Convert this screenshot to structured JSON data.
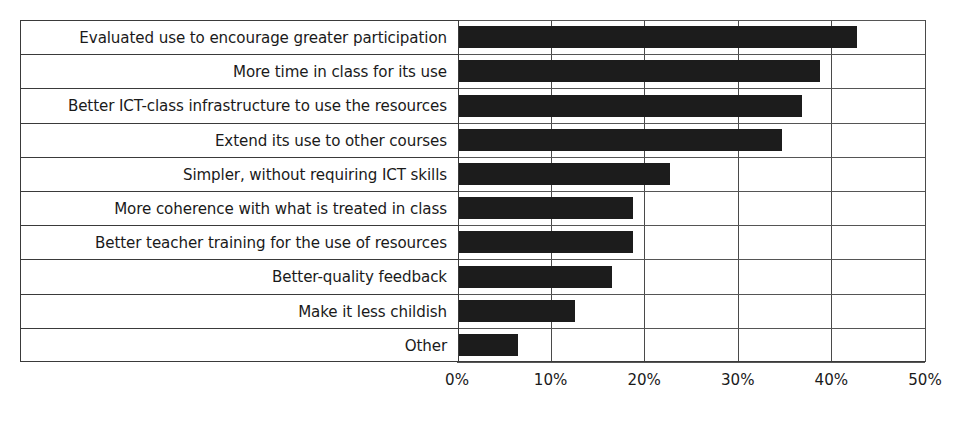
{
  "chart_data": {
    "type": "bar",
    "orientation": "horizontal",
    "title": "",
    "xlabel": "",
    "ylabel": "",
    "xlim": [
      0,
      50
    ],
    "xticks": [
      0,
      10,
      20,
      30,
      40,
      50
    ],
    "xtick_labels": [
      "0%",
      "10%",
      "20%",
      "30%",
      "40%",
      "50%"
    ],
    "grid": "vertical",
    "legend": "none",
    "bar_color": "#1c1c1c",
    "categories": [
      "Evaluated use to encourage greater participation",
      "More time in class for its use",
      "Better ICT-class infrastructure to use the resources",
      "Extend its use to other courses",
      "Simpler, without requiring ICT skills",
      "More coherence with what is treated in class",
      "Better teacher training for the use of resources",
      "Better-quality feedback",
      "Make it less childish",
      "Other"
    ],
    "values": [
      42.7,
      38.8,
      36.9,
      34.7,
      22.8,
      18.8,
      18.8,
      16.6,
      12.6,
      6.5
    ]
  },
  "axis": {
    "tick_0": "0%",
    "tick_1": "10%",
    "tick_2": "20%",
    "tick_3": "30%",
    "tick_4": "40%",
    "tick_5": "50%"
  },
  "labels": {
    "row_0": "Evaluated use to encourage greater participation",
    "row_1": "More time in class for its use",
    "row_2": "Better ICT-class infrastructure to use the resources",
    "row_3": "Extend its use to other courses",
    "row_4": "Simpler, without requiring ICT skills",
    "row_5": "More coherence with what is treated in class",
    "row_6": "Better teacher training for the use of resources",
    "row_7": "Better-quality feedback",
    "row_8": "Make it less childish",
    "row_9": "Other"
  }
}
